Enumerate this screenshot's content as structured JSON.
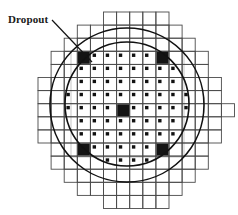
{
  "figure": {
    "background_color": "#ffffff",
    "annotation": {
      "label": "Dropout",
      "label_x": 8,
      "label_y": 13,
      "leader_line": {
        "x1": 52,
        "y1": 20,
        "x2": 92,
        "y2": 62
      }
    },
    "grid": {
      "cell_size": 13.1,
      "origin_x": 38.0,
      "origin_y": 12.0,
      "columns": 15,
      "rows": 15,
      "stroke_color": "#4a4a4a",
      "stroke_width": 0.9,
      "pixel_marker_color": "#111111",
      "pixel_marker_size": 3.4,
      "row_spans": [
        {
          "row": 0,
          "start": 5,
          "end": 10
        },
        {
          "row": 1,
          "start": 3,
          "end": 11
        },
        {
          "row": 2,
          "start": 2,
          "end": 12
        },
        {
          "row": 3,
          "start": 1,
          "end": 13
        },
        {
          "row": 4,
          "start": 1,
          "end": 13
        },
        {
          "row": 5,
          "start": 0,
          "end": 14
        },
        {
          "row": 6,
          "start": 0,
          "end": 14
        },
        {
          "row": 7,
          "start": 0,
          "end": 15
        },
        {
          "row": 8,
          "start": 0,
          "end": 14
        },
        {
          "row": 9,
          "start": 0,
          "end": 14
        },
        {
          "row": 10,
          "start": 1,
          "end": 13
        },
        {
          "row": 11,
          "start": 1,
          "end": 13
        },
        {
          "row": 12,
          "start": 2,
          "end": 12
        },
        {
          "row": 13,
          "start": 3,
          "end": 11
        },
        {
          "row": 14,
          "start": 5,
          "end": 10
        }
      ]
    },
    "circles": [
      {
        "name": "inner-circle",
        "cx": 127,
        "cy": 104,
        "r": 62,
        "stroke": "#111111",
        "stroke_width": 1.6
      },
      {
        "name": "outer-circle",
        "cx": 127,
        "cy": 105,
        "r": 77,
        "stroke": "#111111",
        "stroke_width": 1.6
      }
    ],
    "dropouts": [
      {
        "name": "dropout-upper-left",
        "col": 3,
        "row": 3,
        "fill": "#141414"
      },
      {
        "name": "dropout-upper-right",
        "col": 9,
        "row": 3,
        "fill": "#141414"
      },
      {
        "name": "dropout-center",
        "col": 6,
        "row": 7,
        "fill": "#141414"
      },
      {
        "name": "dropout-lower-left",
        "col": 3,
        "row": 10,
        "fill": "#141414"
      },
      {
        "name": "dropout-lower-right",
        "col": 9,
        "row": 10,
        "fill": "#141414"
      }
    ],
    "guide_box": {
      "x1": 71,
      "y1": 51,
      "x2": 184,
      "y2": 157,
      "stroke": "#b8b8b8",
      "stroke_width": 0.8
    }
  }
}
